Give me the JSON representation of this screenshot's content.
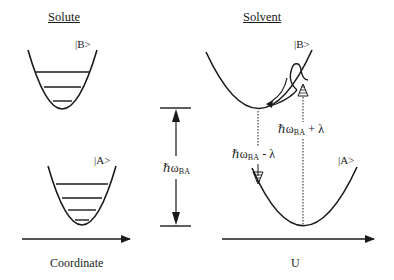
{
  "titles": {
    "solute": "Solute",
    "solvent": "Solvent"
  },
  "solute": {
    "upper_state": "|B>",
    "lower_state": "|A>",
    "axis_label": "Coordinate",
    "upper_well": {
      "left": [
        28,
        50
      ],
      "bottom": [
        62,
        109
      ],
      "right": [
        97,
        50
      ],
      "levels_y": [
        72,
        87,
        101
      ]
    },
    "lower_well": {
      "left": [
        48,
        166
      ],
      "bottom": [
        82,
        225
      ],
      "right": [
        116,
        166
      ],
      "levels_y": [
        184,
        198,
        210,
        220
      ]
    }
  },
  "energy_gap": {
    "symbol": "ℏω",
    "subscript": "BA",
    "top_y": 108,
    "bottom_y": 226,
    "x": 176
  },
  "solvent": {
    "upper_state": "|B>",
    "lower_state": "|A>",
    "axis_label": "U",
    "upper_curve": {
      "left": [
        206,
        52
      ],
      "min": [
        259,
        108
      ],
      "right": [
        312,
        50
      ]
    },
    "lower_curve": {
      "left": [
        252,
        168
      ],
      "min": [
        303,
        226
      ],
      "right": [
        357,
        167
      ]
    },
    "emission_label": {
      "symbol": "ℏω",
      "subscript": "BA",
      "suffix": " - λ"
    },
    "absorption_label": {
      "symbol": "ℏω",
      "subscript": "BA",
      "suffix": " + λ"
    }
  },
  "colors": {
    "ink": "#1a1a1a",
    "background": "#ffffff"
  }
}
